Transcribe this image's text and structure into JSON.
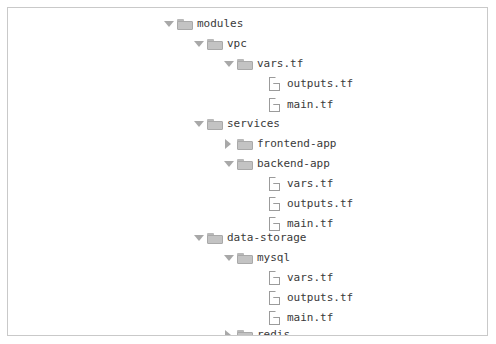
{
  "panel": {
    "name": "file-tree-panel",
    "border_color": "#c9c9c9",
    "background_color": "#ffffff"
  },
  "theme": {
    "folder_fill": "#c3c3c3",
    "folder_stroke": "#a9a9a9",
    "file_stroke": "#9b9b9b",
    "twisty_color": "#a8a8a8",
    "text_color": "#3a3a3a"
  },
  "tree": {
    "indent_px": 30,
    "base_left_px": 155,
    "row_height_px": 20,
    "items": [
      {
        "label": "modules",
        "depth": 0,
        "kind": "folder",
        "state": "expanded",
        "icon": "folder-open-icon"
      },
      {
        "label": "vpc",
        "depth": 1,
        "kind": "folder",
        "state": "expanded",
        "icon": "folder-open-icon"
      },
      {
        "label": "vars.tf",
        "depth": 2,
        "kind": "folder",
        "state": "expanded",
        "icon": "folder-open-icon"
      },
      {
        "label": "outputs.tf",
        "depth": 3,
        "kind": "file",
        "state": "leaf",
        "icon": "file-icon"
      },
      {
        "label": "main.tf",
        "depth": 3,
        "kind": "file",
        "state": "leaf",
        "icon": "file-icon"
      },
      {
        "label": "services",
        "depth": 1,
        "kind": "folder",
        "state": "expanded",
        "icon": "folder-open-icon"
      },
      {
        "label": "frontend-app",
        "depth": 2,
        "kind": "folder",
        "state": "collapsed",
        "icon": "folder-closed-icon"
      },
      {
        "label": "backend-app",
        "depth": 2,
        "kind": "folder",
        "state": "expanded",
        "icon": "folder-open-icon"
      },
      {
        "label": "vars.tf",
        "depth": 3,
        "kind": "file",
        "state": "leaf",
        "icon": "file-icon"
      },
      {
        "label": "outputs.tf",
        "depth": 3,
        "kind": "file",
        "state": "leaf",
        "icon": "file-icon"
      },
      {
        "label": "main.tf",
        "depth": 3,
        "kind": "file",
        "state": "leaf",
        "icon": "file-icon"
      },
      {
        "label": "data-storage",
        "depth": 1,
        "kind": "folder",
        "state": "expanded",
        "icon": "folder-open-icon"
      },
      {
        "label": "mysql",
        "depth": 2,
        "kind": "folder",
        "state": "expanded",
        "icon": "folder-open-icon"
      },
      {
        "label": "vars.tf",
        "depth": 3,
        "kind": "file",
        "state": "leaf",
        "icon": "file-icon"
      },
      {
        "label": "outputs.tf",
        "depth": 3,
        "kind": "file",
        "state": "leaf",
        "icon": "file-icon"
      },
      {
        "label": "main.tf",
        "depth": 3,
        "kind": "file",
        "state": "leaf",
        "icon": "file-icon"
      },
      {
        "label": "redis",
        "depth": 2,
        "kind": "folder",
        "state": "collapsed",
        "icon": "folder-closed-icon"
      }
    ],
    "row_tops": [
      6,
      26,
      46,
      66,
      87,
      106,
      126,
      146,
      166,
      186,
      206,
      220,
      240,
      260,
      280,
      300,
      317
    ]
  }
}
